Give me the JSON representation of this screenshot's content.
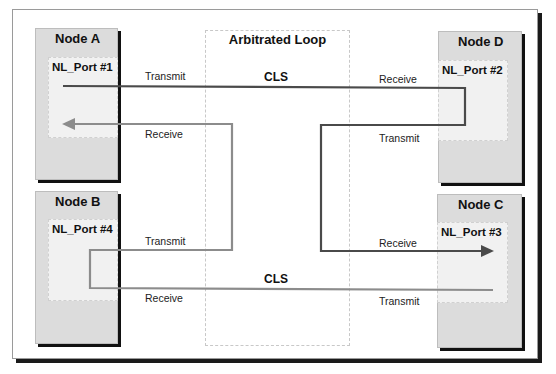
{
  "diagram": {
    "title": "Arbitrated Loop",
    "nodes": [
      {
        "id": "A",
        "name": "Node A",
        "port": "NL_Port #1",
        "transmit_label": "Transmit",
        "receive_label": "Receive"
      },
      {
        "id": "D",
        "name": "Node D",
        "port": "NL_Port #2",
        "transmit_label": "Transmit",
        "receive_label": "Receive"
      },
      {
        "id": "B",
        "name": "Node B",
        "port": "NL_Port #4",
        "transmit_label": "Transmit",
        "receive_label": "Receive"
      },
      {
        "id": "C",
        "name": "Node C",
        "port": "NL_Port #3",
        "transmit_label": "Transmit",
        "receive_label": "Receive"
      }
    ],
    "connections": [
      {
        "from": "NL_Port #1",
        "to": "NL_Port #2",
        "label": "CLS",
        "style": "dark"
      },
      {
        "from": "NL_Port #2",
        "to": "NL_Port #3",
        "label": "",
        "style": "dark"
      },
      {
        "from": "NL_Port #4",
        "to": "NL_Port #1",
        "label": "",
        "style": "light"
      },
      {
        "from": "NL_Port #3",
        "to": "NL_Port #4",
        "label": "CLS",
        "style": "light"
      }
    ],
    "cls_top": "CLS",
    "cls_bottom": "CLS",
    "colors": {
      "dark_wire": "#4a4a4a",
      "light_wire": "#8c8c8c",
      "node_fill": "#dcdcdc",
      "port_fill": "#f1f1f1"
    }
  }
}
